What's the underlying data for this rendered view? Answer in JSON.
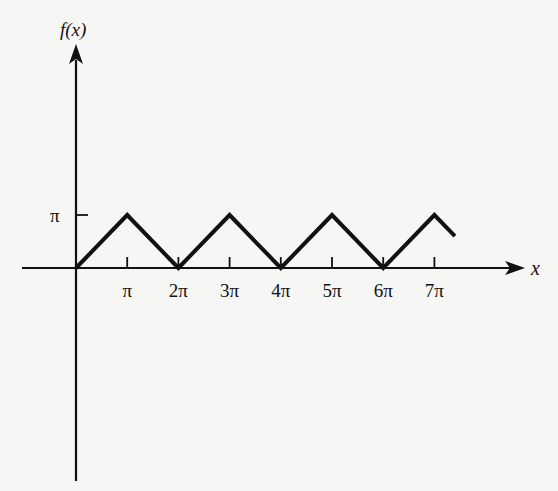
{
  "chart_data": {
    "type": "line",
    "title": "",
    "xlabel": "x",
    "ylabel": "f(x)",
    "x_ticks": [
      "π",
      "2π",
      "3π",
      "4π",
      "5π",
      "6π",
      "7π"
    ],
    "y_ticks": [
      "π"
    ],
    "x_unit": "π",
    "series": [
      {
        "name": "f(x) triangle wave",
        "x": [
          0,
          1,
          2,
          3,
          4,
          5,
          6,
          7,
          7.4
        ],
        "y": [
          0,
          1,
          0,
          1,
          0,
          1,
          0,
          1,
          0.6
        ],
        "units_note": "x and y in multiples of π"
      }
    ],
    "xlim": [
      0,
      8.6
    ],
    "ylim": [
      -4,
      4.4
    ],
    "grid": false,
    "legend": "none"
  },
  "colors": {
    "background": "#f6f6f4",
    "ink": "#111111"
  }
}
